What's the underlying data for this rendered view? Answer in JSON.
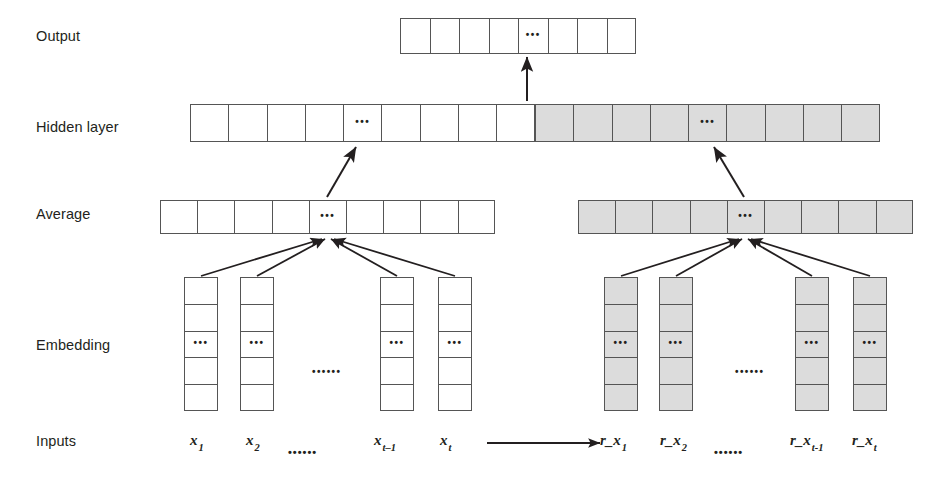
{
  "figure": {
    "cell_dots": "•••",
    "sequence_dots": "••••••",
    "colors": {
      "stroke": "#555555",
      "shaded_fill": "#dcdcdc",
      "plain_fill": "#ffffff",
      "text": "#231f20",
      "arrow": "#231f20"
    }
  },
  "row_labels": [
    {
      "id": "output",
      "label": "Output"
    },
    {
      "id": "hidden",
      "label": "Hidden layer"
    },
    {
      "id": "average",
      "label": "Average"
    },
    {
      "id": "embedding",
      "label": "Embedding"
    },
    {
      "id": "inputs",
      "label": "Inputs"
    }
  ],
  "layers": {
    "output": {
      "label": "Output",
      "cell_count": 8,
      "dots_index": 4,
      "shaded": false
    },
    "hidden": {
      "label": "Hidden layer",
      "left_half": {
        "cell_count": 9,
        "dots_index": 4,
        "shaded": false
      },
      "right_half": {
        "cell_count": 9,
        "dots_index": 4,
        "shaded": true
      }
    },
    "average": {
      "label": "Average",
      "left": {
        "cell_count": 9,
        "dots_index": 4,
        "shaded": false
      },
      "right": {
        "cell_count": 9,
        "dots_index": 4,
        "shaded": true
      }
    },
    "embedding": {
      "label": "Embedding",
      "cells_per_column": 5,
      "dots_row_index": 2,
      "left_columns": [
        {
          "id": "emb-x1",
          "shaded": false
        },
        {
          "id": "emb-x2",
          "shaded": false
        },
        {
          "id": "emb-xt-1",
          "shaded": false
        },
        {
          "id": "emb-xt",
          "shaded": false
        }
      ],
      "right_columns": [
        {
          "id": "emb-rx1",
          "shaded": true
        },
        {
          "id": "emb-rx2",
          "shaded": true
        },
        {
          "id": "emb-rxt-1",
          "shaded": true
        },
        {
          "id": "emb-rxt",
          "shaded": true
        }
      ]
    },
    "inputs": {
      "label": "Inputs",
      "left_tokens": [
        {
          "id": "x1",
          "base": "x",
          "sub": "1"
        },
        {
          "id": "x2",
          "base": "x",
          "sub": "2"
        },
        {
          "id": "xt-1",
          "base": "x",
          "sub": "t–1"
        },
        {
          "id": "xt",
          "base": "x",
          "sub": "t"
        }
      ],
      "right_tokens": [
        {
          "id": "r_x1",
          "base": "r_x",
          "sub": "1"
        },
        {
          "id": "r_x2",
          "base": "r_x",
          "sub": "2"
        },
        {
          "id": "r_xt-1",
          "base": "r_x",
          "sub": "t-1"
        },
        {
          "id": "r_xt",
          "base": "r_x",
          "sub": "t"
        }
      ],
      "transform_arrow": "→"
    }
  }
}
